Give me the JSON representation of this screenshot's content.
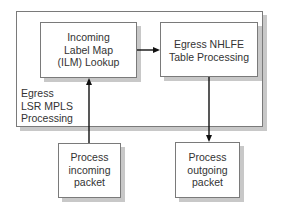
{
  "diagram": {
    "container": {
      "label_lines": [
        "Egress",
        "LSR MPLS",
        "Processing"
      ]
    },
    "nodes": {
      "ilm": {
        "lines": [
          "Incoming",
          "Label Map",
          "(ILM) Lookup"
        ]
      },
      "nhlfe": {
        "lines": [
          "Egress NHLFE",
          "Table Processing"
        ]
      },
      "incoming": {
        "lines": [
          "Process",
          "incoming",
          "packet"
        ]
      },
      "outgoing": {
        "lines": [
          "Process",
          "outgoing",
          "packet"
        ]
      }
    },
    "edges": [
      {
        "from": "incoming",
        "to": "ilm"
      },
      {
        "from": "ilm",
        "to": "nhlfe"
      },
      {
        "from": "nhlfe",
        "to": "outgoing"
      }
    ],
    "colors": {
      "border": "#7a7a7a",
      "shadow": "#c8c8c8",
      "line": "#111111",
      "text": "#333333"
    }
  }
}
